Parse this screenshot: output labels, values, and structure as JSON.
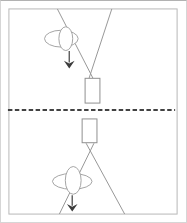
{
  "figure": {
    "background_color": "#ffffff",
    "frame_color": "#b7b7b7",
    "separator_color": "#424242",
    "string_line_color": "#979797",
    "shape_outline_color": "#a4a4a4",
    "weight_outline_color": "#8f8f8f",
    "arrow_color": "#3c3c3c"
  },
  "diagram": {
    "viewbox": "0 0 187 223",
    "shapes": [
      {
        "name": "panel-frame",
        "type": "rect",
        "x": 8,
        "y": 8,
        "w": 170,
        "h": 207,
        "fill": "#ffffff",
        "stroke": "#b7b7b7",
        "width": 1
      },
      {
        "name": "top-left-string-line",
        "type": "line",
        "x1": 57,
        "y1": 8,
        "x2": 93,
        "y2": 78,
        "stroke": "#979797",
        "width": 1
      },
      {
        "name": "top-right-string-line",
        "type": "line",
        "x1": 112,
        "y1": 8,
        "x2": 89,
        "y2": 78,
        "stroke": "#979797",
        "width": 1
      },
      {
        "name": "top-horizontal-ellipse",
        "type": "ellipse",
        "cx": 61,
        "cy": 38,
        "rx": 17,
        "ry": 8.5,
        "fill": "#ffffff",
        "stroke": "#a4a4a4",
        "width": 1
      },
      {
        "name": "top-vertical-ellipse",
        "type": "ellipse",
        "cx": 65.5,
        "cy": 38,
        "rx": 7,
        "ry": 12,
        "fill": "#ffffff",
        "stroke": "#a4a4a4",
        "width": 1
      },
      {
        "name": "top-arrow-shaft",
        "type": "line",
        "x1": 69,
        "y1": 50.5,
        "x2": 69,
        "y2": 62,
        "stroke": "#5a5a5a",
        "width": 1.4
      },
      {
        "name": "top-arrow-head",
        "type": "polygon",
        "points": "69,68 63.6,60.2 69,63 74.4,60.2",
        "fill": "#3c3c3c"
      },
      {
        "name": "top-weight-rect",
        "type": "rect",
        "x": 85,
        "y": 78,
        "w": 15,
        "h": 25,
        "fill": "#ffffff",
        "stroke": "#8f8f8f",
        "width": 1
      },
      {
        "name": "bottom-weight-rect",
        "type": "rect",
        "x": 82,
        "y": 119,
        "w": 15,
        "h": 24,
        "fill": "#ffffff",
        "stroke": "#8f8f8f",
        "width": 1
      },
      {
        "name": "bottom-left-string-line",
        "type": "line",
        "x1": 94,
        "y1": 143.5,
        "x2": 59,
        "y2": 215,
        "stroke": "#979797",
        "width": 1
      },
      {
        "name": "bottom-right-string-line",
        "type": "line",
        "x1": 86,
        "y1": 143.5,
        "x2": 125,
        "y2": 215,
        "stroke": "#979797",
        "width": 1
      },
      {
        "name": "bottom-horizontal-ellipse",
        "type": "ellipse",
        "cx": 72,
        "cy": 182,
        "rx": 20,
        "ry": 8,
        "fill": "#ffffff",
        "stroke": "#a4a4a4",
        "width": 1
      },
      {
        "name": "bottom-vertical-ellipse",
        "type": "ellipse",
        "cx": 73,
        "cy": 181,
        "rx": 8,
        "ry": 14,
        "fill": "#ffffff",
        "stroke": "#a4a4a4",
        "width": 1
      },
      {
        "name": "bottom-arrow-shaft",
        "type": "line",
        "x1": 72,
        "y1": 196,
        "x2": 72,
        "y2": 206.5,
        "stroke": "#5a5a5a",
        "width": 1.4
      },
      {
        "name": "bottom-arrow-head",
        "type": "polygon",
        "points": "72,212.5 66.6,204.8 72,207.5 77.4,204.8",
        "fill": "#3c3c3c"
      },
      {
        "name": "panel-separator-dashed-line",
        "type": "line",
        "x1": 7,
        "y1": 110,
        "x2": 176,
        "y2": 110,
        "stroke": "#424242",
        "width": 2,
        "dash": "4.5 2.5"
      }
    ]
  }
}
